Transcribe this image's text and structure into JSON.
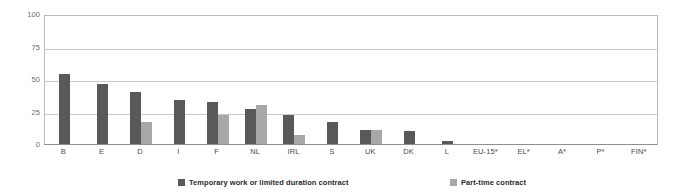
{
  "chart_data": {
    "type": "bar",
    "title": "",
    "subtitle": "",
    "xlabel": "",
    "ylabel": "",
    "ylim": [
      0,
      100
    ],
    "yticks": [
      0,
      25,
      50,
      75,
      100
    ],
    "ytick_labels": [
      "0",
      "25",
      "50",
      "75",
      "100"
    ],
    "grid": true,
    "legend_position": "bottom",
    "categories": [
      "B",
      "E",
      "D",
      "I",
      "F",
      "NL",
      "IRL",
      "S",
      "UK",
      "DK",
      "L",
      "EU-15*",
      "EL*",
      "A*",
      "P*",
      "FIN*"
    ],
    "series": [
      {
        "name": "Temporary work or limited duration contract",
        "color": "#595959",
        "values": [
          54,
          46,
          40,
          34,
          32,
          27,
          22,
          17,
          11,
          10,
          2,
          null,
          null,
          null,
          null,
          null
        ]
      },
      {
        "name": "Part-time contract",
        "color": "#a8a8a8",
        "values": [
          null,
          null,
          17,
          null,
          22,
          30,
          7,
          null,
          11,
          null,
          null,
          null,
          null,
          null,
          null,
          null
        ]
      }
    ]
  },
  "legend": {
    "entries": [
      {
        "label": "Temporary work or limited duration contract",
        "color": "#595959"
      },
      {
        "label": "Part-time contract",
        "color": "#a8a8a8"
      }
    ]
  }
}
